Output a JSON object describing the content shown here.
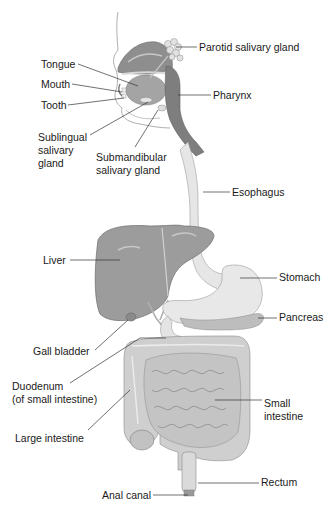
{
  "diagram": {
    "labels": [
      {
        "id": "parotid",
        "text": "Parotid salivary gland",
        "x": 199,
        "y": 41
      },
      {
        "id": "tongue",
        "text": "Tongue",
        "x": 41,
        "y": 58
      },
      {
        "id": "mouth",
        "text": "Mouth",
        "x": 41,
        "y": 78
      },
      {
        "id": "pharynx",
        "text": "Pharynx",
        "x": 213,
        "y": 89
      },
      {
        "id": "tooth",
        "text": "Tooth",
        "x": 41,
        "y": 99
      },
      {
        "id": "sublingual",
        "text": "Sublingual\nsalivary\ngland",
        "x": 38,
        "y": 131
      },
      {
        "id": "submandibular",
        "text": "Submandibular\nsalivary gland",
        "x": 96,
        "y": 151
      },
      {
        "id": "esophagus",
        "text": "Esophagus",
        "x": 232,
        "y": 186
      },
      {
        "id": "liver",
        "text": "Liver",
        "x": 43,
        "y": 254
      },
      {
        "id": "stomach",
        "text": "Stomach",
        "x": 279,
        "y": 271
      },
      {
        "id": "pancreas",
        "text": "Pancreas",
        "x": 279,
        "y": 311
      },
      {
        "id": "gallbladder",
        "text": "Gall bladder",
        "x": 33,
        "y": 345
      },
      {
        "id": "duodenum",
        "text": "Duodenum\n(of small intestine)",
        "x": 12,
        "y": 380
      },
      {
        "id": "small_intestine",
        "text": "Small\nintestine",
        "x": 264,
        "y": 397
      },
      {
        "id": "large_intestine",
        "text": "Large intestine",
        "x": 15,
        "y": 432
      },
      {
        "id": "rectum",
        "text": "Rectum",
        "x": 261,
        "y": 476
      },
      {
        "id": "anal_canal",
        "text": "Anal canal",
        "x": 102,
        "y": 489
      }
    ],
    "leaders": [
      {
        "id": "parotid",
        "x1": 197,
        "y1": 47,
        "x2": 176,
        "y2": 47
      },
      {
        "id": "tongue",
        "x1": 78,
        "y1": 64,
        "x2": 138,
        "y2": 86
      },
      {
        "id": "mouth",
        "x1": 72,
        "y1": 84,
        "x2": 122,
        "y2": 92
      },
      {
        "id": "pharynx",
        "x1": 211,
        "y1": 95,
        "x2": 178,
        "y2": 95
      },
      {
        "id": "tooth",
        "x1": 68,
        "y1": 105,
        "x2": 124,
        "y2": 98
      },
      {
        "id": "sublingual",
        "x1": 90,
        "y1": 135,
        "x2": 148,
        "y2": 102
      },
      {
        "id": "submandibular",
        "x1": 135,
        "y1": 147,
        "x2": 158,
        "y2": 110
      },
      {
        "id": "esophagus",
        "x1": 230,
        "y1": 192,
        "x2": 203,
        "y2": 192
      },
      {
        "id": "liver",
        "x1": 70,
        "y1": 260,
        "x2": 120,
        "y2": 260
      },
      {
        "id": "stomach",
        "x1": 277,
        "y1": 278,
        "x2": 240,
        "y2": 278
      },
      {
        "id": "pancreas",
        "x1": 277,
        "y1": 318,
        "x2": 258,
        "y2": 318
      },
      {
        "id": "gallbladder",
        "x1": 95,
        "y1": 350,
        "x2": 128,
        "y2": 320
      },
      {
        "id": "duodenum",
        "x1": 70,
        "y1": 383,
        "x2": 140,
        "y2": 338
      },
      {
        "id": "small_intestine",
        "x1": 262,
        "y1": 400,
        "x2": 215,
        "y2": 400
      },
      {
        "id": "large_intestine",
        "x1": 88,
        "y1": 430,
        "x2": 130,
        "y2": 390
      },
      {
        "id": "rectum",
        "x1": 259,
        "y1": 483,
        "x2": 198,
        "y2": 483
      },
      {
        "id": "anal_canal",
        "x1": 153,
        "y1": 495,
        "x2": 192,
        "y2": 495
      }
    ],
    "colors": {
      "text": "#1a1a1a",
      "leader": "#333333",
      "organ_dark": "#8a8a8a",
      "organ_mid": "#a8a8a8",
      "organ_light": "#d6d6d6",
      "organ_pale": "#e8e8e8",
      "outline": "#6e6e6e"
    }
  }
}
